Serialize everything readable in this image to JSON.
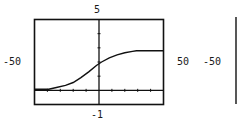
{
  "chart_data": {
    "type": "line",
    "title": "",
    "xlabel": "",
    "ylabel": "",
    "xlim": [
      -50,
      50
    ],
    "ylim": [
      -1,
      5
    ],
    "xscale": 10,
    "yscale": 1,
    "grid": false,
    "legend": null,
    "window_labels": {
      "ymax": "5",
      "ymin": "-1",
      "xmin": "-50",
      "xmax": "50"
    },
    "series": [
      {
        "name": "logistic curve",
        "x": [
          -50,
          -39,
          -33,
          -26,
          -20,
          -14,
          -8,
          -2,
          2,
          8,
          14,
          20,
          26,
          29,
          50
        ],
        "y": [
          0.07,
          0.07,
          0.2,
          0.35,
          0.55,
          0.9,
          1.3,
          1.75,
          2.0,
          2.3,
          2.5,
          2.65,
          2.75,
          2.8,
          2.8
        ]
      }
    ]
  },
  "side_labels": {
    "right_xmax": "50",
    "second_xmin": "-50"
  }
}
